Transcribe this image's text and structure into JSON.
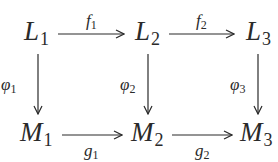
{
  "diagram": {
    "type": "commutative-diagram",
    "nodes": {
      "L1": {
        "base": "L",
        "sub": "1"
      },
      "L2": {
        "base": "L",
        "sub": "2"
      },
      "L3": {
        "base": "L",
        "sub": "3"
      },
      "M1": {
        "base": "M",
        "sub": "1"
      },
      "M2": {
        "base": "M",
        "sub": "2"
      },
      "M3": {
        "base": "M",
        "sub": "3"
      }
    },
    "arrows": {
      "f1": {
        "from": "L1",
        "to": "L2",
        "base": "f",
        "sub": "1"
      },
      "f2": {
        "from": "L2",
        "to": "L3",
        "base": "f",
        "sub": "2"
      },
      "g1": {
        "from": "M1",
        "to": "M2",
        "base": "g",
        "sub": "1"
      },
      "g2": {
        "from": "M2",
        "to": "M3",
        "base": "g",
        "sub": "2"
      },
      "phi1": {
        "from": "L1",
        "to": "M1",
        "base": "φ",
        "sub": "1"
      },
      "phi2": {
        "from": "L2",
        "to": "M2",
        "base": "φ",
        "sub": "2"
      },
      "phi3": {
        "from": "L3",
        "to": "M3",
        "base": "φ",
        "sub": "3"
      }
    },
    "color": "#2a2a2a"
  }
}
